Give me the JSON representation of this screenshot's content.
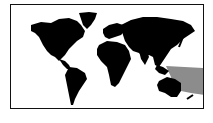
{
  "map": {
    "title": "World map",
    "style": "black silhouette continents on white",
    "land_color": "#000000",
    "ocean_color": "#ffffff",
    "frame_color": "#111111",
    "highlight": {
      "label": "Western Pacific / Oceania region",
      "color": "#8c8c8c"
    },
    "regions": [
      "North America",
      "South America",
      "Europe",
      "Africa",
      "Asia",
      "Australia",
      "Greenland"
    ]
  }
}
